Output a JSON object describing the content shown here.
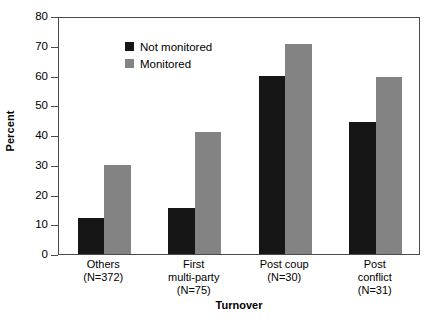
{
  "chart_data": {
    "type": "bar",
    "title": "",
    "xlabel": "Turnover",
    "ylabel": "Percent",
    "ylim": [
      0,
      80
    ],
    "yticks": [
      0,
      10,
      20,
      30,
      40,
      50,
      60,
      70,
      80
    ],
    "ytick_labels": [
      "0",
      "10",
      "20",
      "30",
      "40",
      "50",
      "60",
      "70",
      "80"
    ],
    "grid": false,
    "legend_position": "top-left",
    "categories": [
      "Others",
      "First multi-party",
      "Post coup",
      "Post conflict"
    ],
    "category_lines": [
      [
        "Others"
      ],
      [
        "First",
        "multi-party"
      ],
      [
        "Post coup"
      ],
      [
        "Post",
        "conflict"
      ]
    ],
    "category_counts": [
      "(N=372)",
      "(N=75)",
      "(N=30)",
      "(N=31)"
    ],
    "series": [
      {
        "name": "Not monitored",
        "color": "#161616",
        "values": [
          12,
          15.5,
          60,
          44.5
        ]
      },
      {
        "name": "Monitored",
        "color": "#838383",
        "values": [
          30,
          41,
          70.5,
          59.5
        ]
      }
    ]
  },
  "colors": {
    "not_monitored": "#161616",
    "monitored": "#838383",
    "axis": "#4a4a4a",
    "background": "#ffffff"
  }
}
